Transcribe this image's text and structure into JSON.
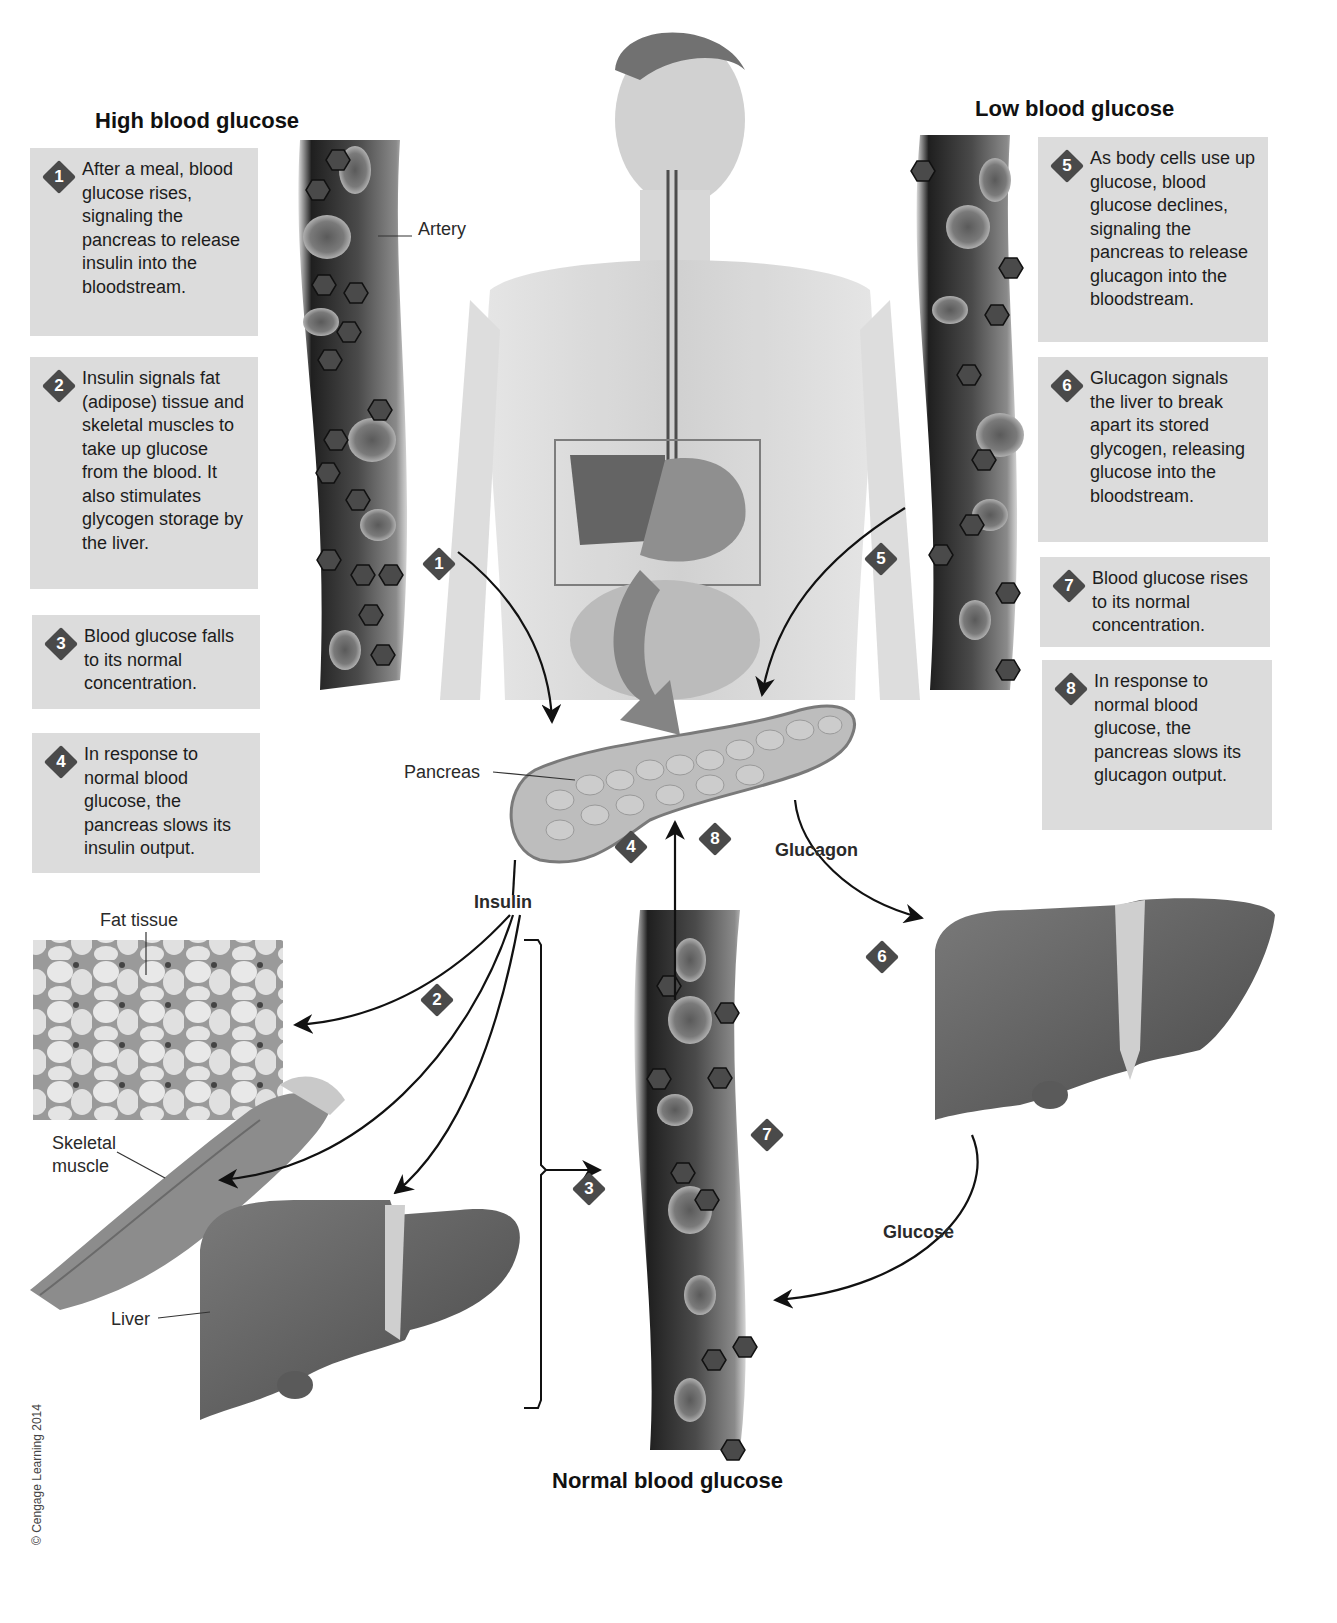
{
  "sections": {
    "high": {
      "title": "High blood glucose"
    },
    "low": {
      "title": "Low blood glucose"
    },
    "normal": {
      "title": "Normal blood glucose"
    }
  },
  "steps": [
    {
      "num": "1",
      "text": "After a meal, blood glucose rises, signaling the pancreas to release insulin into the bloodstream."
    },
    {
      "num": "2",
      "text": "Insulin signals fat (adipose) tissue and skeletal muscles to take up glucose from the blood. It also stimulates glycogen storage by the liver."
    },
    {
      "num": "3",
      "text": "Blood glucose falls to its normal concentration."
    },
    {
      "num": "4",
      "text": "In response to normal blood glucose, the pancreas slows its insulin output."
    },
    {
      "num": "5",
      "text": "As body cells use up glucose, blood glucose declines, signaling the pancreas to release glucagon into the bloodstream."
    },
    {
      "num": "6",
      "text": "Glucagon signals the liver to break apart its stored glycogen, releasing glucose into the bloodstream."
    },
    {
      "num": "7",
      "text": "Blood glucose rises to its normal concentration."
    },
    {
      "num": "8",
      "text": "In response to normal blood glucose, the pancreas slows its glucagon output."
    }
  ],
  "labels": {
    "artery": "Artery",
    "pancreas": "Pancreas",
    "insulin": "Insulin",
    "glucagon": "Glucagon",
    "glucose": "Glucose",
    "fat_tissue": "Fat tissue",
    "skeletal_muscle_1": "Skeletal",
    "skeletal_muscle_2": "muscle",
    "liver": "Liver"
  },
  "markers": [
    "1",
    "2",
    "3",
    "4",
    "5",
    "6",
    "7",
    "8"
  ],
  "copyright": "© Cengage Learning 2014",
  "colors": {
    "box_bg": "#dcdcdc",
    "diamond": "#4a4a4a",
    "artery_dark": "#2b2b2b",
    "organ": "#5a5a5a"
  }
}
